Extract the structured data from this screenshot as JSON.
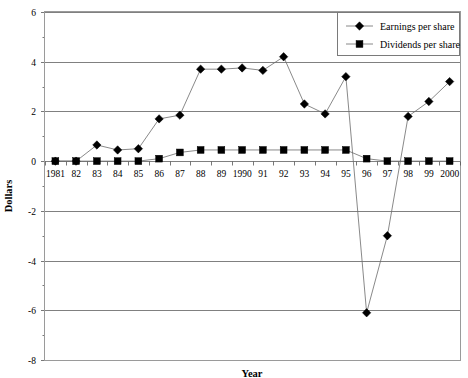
{
  "chart_data": {
    "type": "line",
    "title": "",
    "xlabel": "Year",
    "ylabel": "Dollars",
    "ylim": [
      -8,
      6
    ],
    "ytick_labels": [
      "6",
      "4",
      "2",
      "0",
      "-2",
      "-4",
      "-6",
      "-8"
    ],
    "ytick_values": [
      6,
      4,
      2,
      0,
      -2,
      -4,
      -6,
      -8
    ],
    "grid": "horizontal",
    "legend_position": "top-right",
    "x": [
      1981,
      1982,
      1983,
      1984,
      1985,
      1986,
      1987,
      1988,
      1989,
      1990,
      1991,
      1992,
      1993,
      1994,
      1995,
      1996,
      1997,
      1998,
      1999,
      2000
    ],
    "categories": [
      "1981",
      "82",
      "83",
      "84",
      "85",
      "86",
      "87",
      "88",
      "89",
      "1990",
      "91",
      "92",
      "93",
      "94",
      "95",
      "96",
      "97",
      "98",
      "99",
      "2000"
    ],
    "series": [
      {
        "name": "Earnings per share",
        "marker": "diamond",
        "color": "#000000",
        "values": [
          0.0,
          0.0,
          0.65,
          0.45,
          0.5,
          1.7,
          1.85,
          3.7,
          3.7,
          3.75,
          3.65,
          4.2,
          2.3,
          1.9,
          3.4,
          -6.1,
          -3.0,
          1.8,
          2.4,
          3.2
        ]
      },
      {
        "name": "Dividends per share",
        "marker": "square",
        "color": "#000000",
        "values": [
          0.0,
          0.0,
          0.0,
          0.0,
          0.0,
          0.1,
          0.35,
          0.45,
          0.45,
          0.45,
          0.45,
          0.45,
          0.45,
          0.45,
          0.45,
          0.1,
          0.0,
          0.0,
          0.0,
          0.0
        ]
      }
    ]
  },
  "legend": {
    "entries": [
      {
        "label": "Earnings per share",
        "marker": "diamond"
      },
      {
        "label": "Dividends per share",
        "marker": "square"
      }
    ]
  },
  "colors": {
    "gridline": "#808080",
    "border": "#9a9a9a",
    "series_line": "#6b6b6b",
    "marker": "#000000",
    "background": "#ffffff"
  }
}
